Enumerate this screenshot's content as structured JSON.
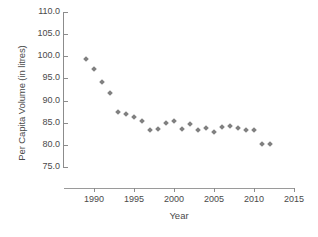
{
  "chart_data": {
    "type": "scatter",
    "title": "",
    "xlabel": "Year",
    "ylabel": "Per Capita Volume (in litres)",
    "xlim": [
      1987,
      2015
    ],
    "ylim": [
      75.0,
      110.0
    ],
    "grid": false,
    "legend": null,
    "marker": {
      "shape": "diamond",
      "color": "#808080",
      "size_px": 4
    },
    "axis_color": "#8c8c8c",
    "text_color": "#4a4a4a",
    "xticks": [
      1990,
      1995,
      2000,
      2005,
      2010,
      2015
    ],
    "xtick_labels": [
      "1990",
      "1995",
      "2000",
      "2005",
      "2010",
      "2015"
    ],
    "yticks": [
      75.0,
      80.0,
      85.0,
      90.0,
      95.0,
      100.0,
      105.0,
      110.0
    ],
    "ytick_labels": [
      "75.0",
      "80.0",
      "85.0",
      "90.0",
      "95.0",
      "100.0",
      "105.0",
      "110.0"
    ],
    "x": [
      1989,
      1990,
      1991,
      1992,
      1993,
      1994,
      1995,
      1996,
      1997,
      1998,
      1999,
      2000,
      2001,
      2002,
      2003,
      2004,
      2005,
      2006,
      2007,
      2008,
      2009,
      2010,
      2011,
      2012
    ],
    "values": [
      99.4,
      97.1,
      94.3,
      91.7,
      87.4,
      86.9,
      86.4,
      85.5,
      83.4,
      83.5,
      85.0,
      85.3,
      83.5,
      84.6,
      83.4,
      83.8,
      83.0,
      84.1,
      84.3,
      83.7,
      83.4,
      83.4,
      80.1,
      80.2
    ],
    "series": [
      {
        "name": "Per Capita Volume",
        "x": [
          1989,
          1990,
          1991,
          1992,
          1993,
          1994,
          1995,
          1996,
          1997,
          1998,
          1999,
          2000,
          2001,
          2002,
          2003,
          2004,
          2005,
          2006,
          2007,
          2008,
          2009,
          2010,
          2011,
          2012
        ],
        "values": [
          99.4,
          97.1,
          94.3,
          91.7,
          87.4,
          86.9,
          86.4,
          85.5,
          83.4,
          83.5,
          85.0,
          85.3,
          83.5,
          84.6,
          83.4,
          83.8,
          83.0,
          84.1,
          84.3,
          83.7,
          83.4,
          83.4,
          80.1,
          80.2
        ]
      }
    ]
  }
}
